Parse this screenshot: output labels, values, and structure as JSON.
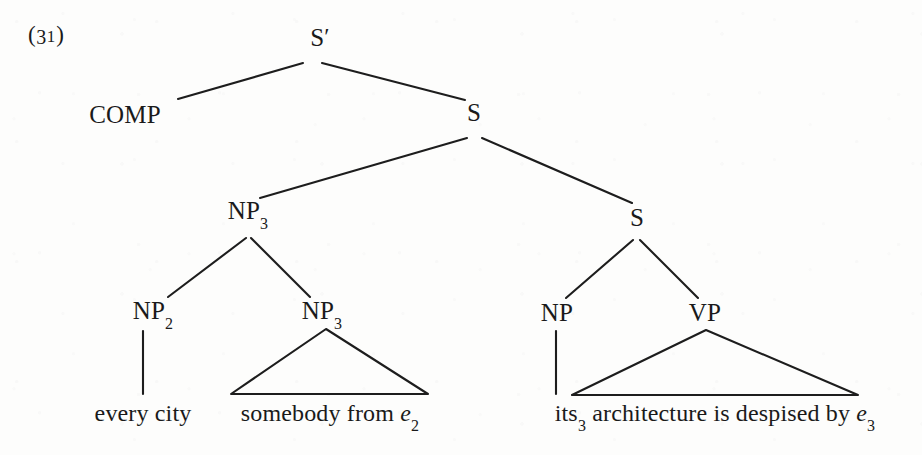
{
  "figure": {
    "example_number_open": "(",
    "example_number_digits": "3",
    "example_number_one": "1",
    "example_number_close": ")",
    "ink_color": "#1a1a1a",
    "background_color": "#fdfdfc"
  },
  "tree": {
    "nodes": [
      {
        "id": "sbar",
        "label": "S",
        "prime": "′",
        "sub": "",
        "x": 320,
        "y": 38
      },
      {
        "id": "comp",
        "label": "COMP",
        "prime": "",
        "sub": "",
        "x": 125,
        "y": 115
      },
      {
        "id": "s1",
        "label": "S",
        "prime": "",
        "sub": "",
        "x": 474,
        "y": 113
      },
      {
        "id": "np3a",
        "label": "NP",
        "prime": "",
        "sub": "3",
        "x": 248,
        "y": 213
      },
      {
        "id": "s2",
        "label": "S",
        "prime": "",
        "sub": "",
        "x": 637,
        "y": 218
      },
      {
        "id": "np2",
        "label": "NP",
        "prime": "",
        "sub": "2",
        "x": 153,
        "y": 313
      },
      {
        "id": "np3b",
        "label": "NP",
        "prime": "",
        "sub": "3",
        "x": 322,
        "y": 313
      },
      {
        "id": "np",
        "label": "NP",
        "prime": "",
        "sub": "",
        "x": 557,
        "y": 313
      },
      {
        "id": "vp",
        "label": "VP",
        "prime": "",
        "sub": "",
        "x": 705,
        "y": 313
      }
    ],
    "edges": [
      {
        "id": "sbar-comp",
        "x1": 303,
        "y1": 63,
        "x2": 178,
        "y2": 99
      },
      {
        "id": "sbar-s1",
        "x1": 322,
        "y1": 63,
        "x2": 465,
        "y2": 100
      },
      {
        "id": "s1-np3a",
        "x1": 467,
        "y1": 138,
        "x2": 260,
        "y2": 198
      },
      {
        "id": "s1-s2",
        "x1": 482,
        "y1": 138,
        "x2": 632,
        "y2": 203
      },
      {
        "id": "np3a-np2",
        "x1": 246,
        "y1": 238,
        "x2": 168,
        "y2": 297
      },
      {
        "id": "np3a-np3b",
        "x1": 251,
        "y1": 238,
        "x2": 310,
        "y2": 297
      },
      {
        "id": "s2-np",
        "x1": 633,
        "y1": 240,
        "x2": 566,
        "y2": 298
      },
      {
        "id": "s2-vp",
        "x1": 640,
        "y1": 240,
        "x2": 698,
        "y2": 298
      },
      {
        "id": "np2-stem",
        "x1": 143,
        "y1": 331,
        "x2": 143,
        "y2": 394
      },
      {
        "id": "np-stem",
        "x1": 556,
        "y1": 331,
        "x2": 556,
        "y2": 394
      }
    ],
    "triangles": [
      {
        "id": "np3b-triangle",
        "apex_x": 326,
        "apex_y": 329,
        "left_x": 231,
        "left_y": 394,
        "right_x": 428,
        "right_y": 394
      },
      {
        "id": "vp-triangle",
        "apex_x": 706,
        "apex_y": 330,
        "left_x": 572,
        "left_y": 395,
        "right_x": 858,
        "right_y": 395
      }
    ],
    "leaves": [
      {
        "id": "leaf-every-city",
        "text": "every city",
        "sub": "",
        "x": 143,
        "y": 400
      },
      {
        "id": "leaf-somebody",
        "pre": "somebody from ",
        "ital": "e",
        "sub": "2",
        "x": 330,
        "y": 400
      },
      {
        "id": "leaf-its-arch",
        "pre_plain": "its",
        "pre_sub": "3",
        "mid": " architecture is despised by ",
        "ital": "e",
        "sub": "3",
        "x": 715,
        "y": 400
      }
    ]
  }
}
